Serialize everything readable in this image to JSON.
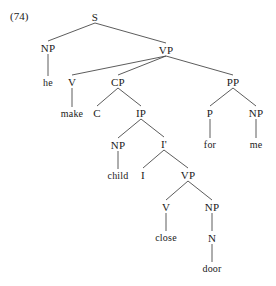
{
  "figure": {
    "example_number": "(74)",
    "sentence": "he make C child I close door for me",
    "ink_color": "#1a1a1a",
    "line_color": "#4a4a4a",
    "background_color": "#ffffff"
  },
  "tree": {
    "nodes": [
      {
        "id": "S",
        "label": "S",
        "x": 95,
        "y": 17,
        "kind": "category"
      },
      {
        "id": "NP1",
        "label": "NP",
        "x": 48,
        "y": 48,
        "kind": "category"
      },
      {
        "id": "VP1",
        "label": "VP",
        "x": 166,
        "y": 50,
        "kind": "category"
      },
      {
        "id": "he",
        "label": "he",
        "x": 48,
        "y": 83,
        "kind": "terminal"
      },
      {
        "id": "V1",
        "label": "V",
        "x": 72,
        "y": 82,
        "kind": "category"
      },
      {
        "id": "CP",
        "label": "CP",
        "x": 118,
        "y": 82,
        "kind": "category"
      },
      {
        "id": "PP",
        "label": "PP",
        "x": 233,
        "y": 82,
        "kind": "category"
      },
      {
        "id": "make",
        "label": "make",
        "x": 72,
        "y": 114,
        "kind": "terminal"
      },
      {
        "id": "C",
        "label": "C",
        "x": 97,
        "y": 113,
        "kind": "category"
      },
      {
        "id": "IP",
        "label": "IP",
        "x": 141,
        "y": 113,
        "kind": "category"
      },
      {
        "id": "P",
        "label": "P",
        "x": 210,
        "y": 113,
        "kind": "category"
      },
      {
        "id": "NP3",
        "label": "NP",
        "x": 256,
        "y": 113,
        "kind": "category"
      },
      {
        "id": "NP2",
        "label": "NP",
        "x": 118,
        "y": 145,
        "kind": "category"
      },
      {
        "id": "Ibar",
        "label": "I'",
        "x": 164,
        "y": 144,
        "kind": "category"
      },
      {
        "id": "for",
        "label": "for",
        "x": 210,
        "y": 145,
        "kind": "terminal"
      },
      {
        "id": "me",
        "label": "me",
        "x": 256,
        "y": 145,
        "kind": "terminal"
      },
      {
        "id": "child",
        "label": "child",
        "x": 118,
        "y": 176,
        "kind": "terminal"
      },
      {
        "id": "I",
        "label": "I",
        "x": 143,
        "y": 175,
        "kind": "category"
      },
      {
        "id": "VP2",
        "label": "VP",
        "x": 188,
        "y": 175,
        "kind": "category"
      },
      {
        "id": "V2",
        "label": "V",
        "x": 166,
        "y": 207,
        "kind": "category"
      },
      {
        "id": "NP4",
        "label": "NP",
        "x": 212,
        "y": 207,
        "kind": "category"
      },
      {
        "id": "close",
        "label": "close",
        "x": 166,
        "y": 238,
        "kind": "terminal"
      },
      {
        "id": "N",
        "label": "N",
        "x": 212,
        "y": 238,
        "kind": "category"
      },
      {
        "id": "door",
        "label": "door",
        "x": 212,
        "y": 269,
        "kind": "terminal"
      }
    ],
    "edges": [
      {
        "from": "S",
        "to": "NP1"
      },
      {
        "from": "S",
        "to": "VP1"
      },
      {
        "from": "NP1",
        "to": "he"
      },
      {
        "from": "VP1",
        "to": "V1"
      },
      {
        "from": "VP1",
        "to": "CP"
      },
      {
        "from": "VP1",
        "to": "PP"
      },
      {
        "from": "V1",
        "to": "make"
      },
      {
        "from": "CP",
        "to": "C"
      },
      {
        "from": "CP",
        "to": "IP"
      },
      {
        "from": "PP",
        "to": "P"
      },
      {
        "from": "PP",
        "to": "NP3"
      },
      {
        "from": "IP",
        "to": "NP2"
      },
      {
        "from": "IP",
        "to": "Ibar"
      },
      {
        "from": "P",
        "to": "for"
      },
      {
        "from": "NP3",
        "to": "me"
      },
      {
        "from": "NP2",
        "to": "child"
      },
      {
        "from": "Ibar",
        "to": "I"
      },
      {
        "from": "Ibar",
        "to": "VP2"
      },
      {
        "from": "VP2",
        "to": "V2"
      },
      {
        "from": "VP2",
        "to": "NP4"
      },
      {
        "from": "V2",
        "to": "close"
      },
      {
        "from": "NP4",
        "to": "N"
      },
      {
        "from": "N",
        "to": "door"
      }
    ]
  }
}
